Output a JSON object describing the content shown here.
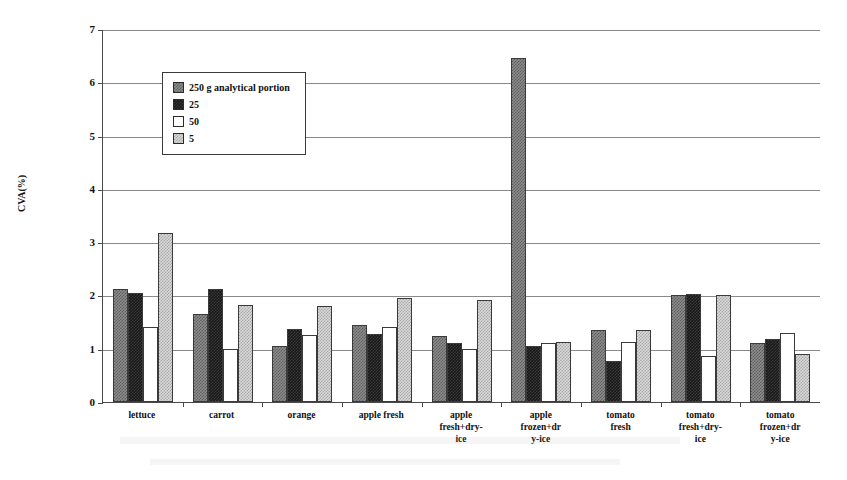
{
  "chart_data": {
    "type": "bar",
    "title": "",
    "xlabel": "",
    "ylabel": "CVA(%)",
    "ylim": [
      0,
      7
    ],
    "ytick_values": [
      0,
      1,
      2,
      3,
      4,
      5,
      6,
      7
    ],
    "ytick_labels": [
      "0",
      "1",
      "2",
      "3",
      "4",
      "5",
      "6",
      "7"
    ],
    "grid": true,
    "legend_position": "upper-left-inside",
    "categories": [
      "lettuce",
      "carrot",
      "orange",
      "apple fresh",
      "apple fresh+dry-ice",
      "apple frozen+dry-ice",
      "tomato fresh",
      "tomato fresh+dry-ice",
      "tomato frozen+dry-ice"
    ],
    "category_lines": [
      [
        "lettuce"
      ],
      [
        "carrot"
      ],
      [
        "orange"
      ],
      [
        "apple fresh"
      ],
      [
        "apple",
        "fresh+dry-",
        "ice"
      ],
      [
        "apple",
        "frozen+dr",
        "y-ice"
      ],
      [
        "tomato",
        "fresh"
      ],
      [
        "tomato",
        "fresh+dry-",
        "ice"
      ],
      [
        "tomato",
        "frozen+dr",
        "y-ice"
      ]
    ],
    "series": [
      {
        "name": "250 g analytical portion",
        "color": "#8d8d8d",
        "pattern": "checker-dark-gray",
        "values": [
          2.12,
          1.66,
          1.05,
          1.45,
          1.24,
          6.45,
          1.35,
          2.0,
          1.1
        ]
      },
      {
        "name": "25",
        "color": "#171717",
        "pattern": "checker-black",
        "values": [
          2.05,
          2.13,
          1.37,
          1.28,
          1.1,
          1.05,
          0.77,
          2.02,
          1.18
        ]
      },
      {
        "name": "50",
        "color": "#ffffff",
        "pattern": "solid-white",
        "values": [
          1.4,
          1.0,
          1.25,
          1.4,
          1.0,
          1.1,
          1.13,
          0.87,
          1.3
        ]
      },
      {
        "name": "5",
        "color": "#d8d8d8",
        "pattern": "checker-light-gray",
        "values": [
          3.17,
          1.83,
          1.8,
          1.96,
          1.92,
          1.12,
          1.35,
          2.0,
          0.9
        ]
      }
    ]
  },
  "legend": {
    "entries": [
      {
        "label": "250 g analytical portion"
      },
      {
        "label": "25"
      },
      {
        "label": "50"
      },
      {
        "label": "5"
      }
    ]
  }
}
